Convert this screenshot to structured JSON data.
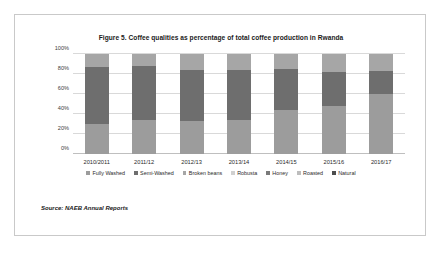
{
  "document": {
    "source_note": "Source: NAEB Annual Reports"
  },
  "chart_data": {
    "type": "bar",
    "stacked": true,
    "title": "Figure 5. Coffee qualities as percentage of total coffee production in Rwanda",
    "xlabel": "",
    "ylabel": "",
    "ylim": [
      0,
      100
    ],
    "yticks": [
      "0%",
      "20%",
      "40%",
      "60%",
      "80%",
      "100%"
    ],
    "ytick_values": [
      0,
      20,
      40,
      60,
      80,
      100
    ],
    "grid": true,
    "legend_position": "bottom",
    "categories": [
      "2010/2011",
      "2011/12",
      "2012/13",
      "2013/14",
      "2014/15",
      "2015/16",
      "2016/17"
    ],
    "series": [
      {
        "name": "Fully Washed",
        "color": "#9c9c9c",
        "values": [
          30,
          34,
          33,
          34,
          44,
          48,
          60
        ]
      },
      {
        "name": "Semi-Washed",
        "color": "#6e6e6e",
        "values": [
          57,
          54,
          51,
          50,
          41,
          34,
          23
        ]
      },
      {
        "name": "Broken beans",
        "color": "#a6a6a6",
        "values": [
          13,
          12,
          16,
          16,
          15,
          18,
          17
        ]
      },
      {
        "name": "Robusta",
        "color": "#d0d0d0",
        "values": [
          0,
          0,
          0,
          0,
          0,
          0,
          0
        ]
      },
      {
        "name": "Honey",
        "color": "#7a7a7a",
        "values": [
          0,
          0,
          0,
          0,
          0,
          0,
          0
        ]
      },
      {
        "name": "Roasted",
        "color": "#bdbdbd",
        "values": [
          0,
          0,
          0,
          0,
          0,
          0,
          0
        ]
      },
      {
        "name": "Natural",
        "color": "#4d4d4d",
        "values": [
          0,
          0,
          0,
          0,
          0,
          0,
          0
        ]
      }
    ]
  }
}
